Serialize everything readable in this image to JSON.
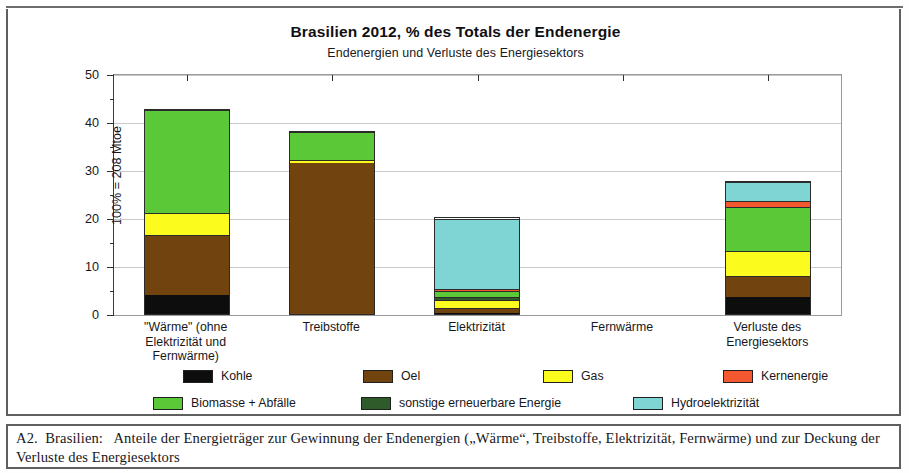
{
  "figure": {
    "caption_label": "A2.  Brasilien:   ",
    "caption_text": "Anteile der Energieträger zur Gewinnung der Endenergien („Wärme“, Treibstoffe, Elektrizität, Fernwärme) und zur Deckung der Verluste des Energiesektors"
  },
  "chart_data": {
    "type": "bar",
    "stacked": true,
    "title": "Brasilien  2012,  % des Totals der Endenergie",
    "subtitle": "Endenergien und Verluste des Energiesektors",
    "ylabel": "100% = 208 Mtoe",
    "xlabel": "",
    "ylim": [
      0,
      50
    ],
    "yticks": [
      0,
      10,
      20,
      30,
      40,
      50
    ],
    "yticklabels": [
      "0",
      "10",
      "20",
      "30",
      "40",
      "50"
    ],
    "yminorticks": [
      5,
      15,
      25,
      35,
      45
    ],
    "grid": "horizontal",
    "legend_position": "bottom",
    "categories": [
      "\"Wärme\" (ohne Elektrizität und Fernwärme)",
      "Treibstoffe",
      "Elektrizität",
      "Fernwärme",
      "Verluste des Energiesektors"
    ],
    "category_lines": [
      [
        "\"Wärme\" (ohne",
        "Elektrizität und",
        "Fernwärme)"
      ],
      [
        "Treibstoffe"
      ],
      [
        "Elektrizität"
      ],
      [
        "Fernwärme"
      ],
      [
        "Verluste des",
        "Energiesektors"
      ]
    ],
    "series": [
      {
        "name": "Kohle",
        "color": "#0d0d0d",
        "values": [
          4.0,
          0.0,
          0.3,
          0.0,
          3.5
        ]
      },
      {
        "name": "Oel",
        "color": "#70430f",
        "values": [
          12.5,
          31.5,
          1.0,
          0.0,
          4.5
        ]
      },
      {
        "name": "Gas",
        "color": "#fbfb1d",
        "values": [
          4.5,
          0.5,
          1.7,
          0.0,
          5.2
        ]
      },
      {
        "name": "Kernenergie",
        "color": "#f4582f",
        "values": [
          0.0,
          0.0,
          0.0,
          0.0,
          1.3
        ]
      },
      {
        "name": "Biomasse + Abfälle",
        "color": "#5bc838",
        "values": [
          21.5,
          6.0,
          1.2,
          0.0,
          9.0
        ]
      },
      {
        "name": "sonstige erneuerbare Energie",
        "color": "#2f5a2a",
        "values": [
          0.0,
          0.0,
          0.5,
          0.0,
          0.0
        ]
      },
      {
        "name": "Hydroelektrizität",
        "color": "#7fd4d4",
        "values": [
          0.0,
          0.0,
          14.8,
          0.0,
          4.0
        ]
      }
    ],
    "stack_order": [
      "Kohle",
      "Oel",
      "Gas",
      "sonstige erneuerbare Energie",
      "Biomasse + Abfälle",
      "Kernenergie",
      "Hydroelektrizität"
    ],
    "totals": [
      42.5,
      38.0,
      19.5,
      0.0,
      27.5
    ],
    "bar_segments": [
      [
        {
          "name": "Kohle",
          "from": 0.0,
          "to": 4.0
        },
        {
          "name": "Oel",
          "from": 4.0,
          "to": 16.5
        },
        {
          "name": "Gas",
          "from": 16.5,
          "to": 21.0
        },
        {
          "name": "Biomasse + Abfälle",
          "from": 21.0,
          "to": 42.5
        }
      ],
      [
        {
          "name": "Oel",
          "from": 0.0,
          "to": 31.5
        },
        {
          "name": "Gas",
          "from": 31.5,
          "to": 32.0
        },
        {
          "name": "Biomasse + Abfälle",
          "from": 32.0,
          "to": 38.0
        }
      ],
      [
        {
          "name": "Kohle",
          "from": 0.0,
          "to": 0.3
        },
        {
          "name": "Oel",
          "from": 0.3,
          "to": 1.3
        },
        {
          "name": "Gas",
          "from": 1.3,
          "to": 3.0
        },
        {
          "name": "sonstige erneuerbare Energie",
          "from": 3.0,
          "to": 3.5
        },
        {
          "name": "Biomasse + Abfälle",
          "from": 3.5,
          "to": 4.7
        },
        {
          "name": "Kernenergie",
          "from": 4.7,
          "to": 5.2
        },
        {
          "name": "Hydroelektrizität",
          "from": 5.2,
          "to": 19.9
        }
      ],
      [],
      [
        {
          "name": "Kohle",
          "from": 0.0,
          "to": 3.5
        },
        {
          "name": "Oel",
          "from": 3.5,
          "to": 8.0
        },
        {
          "name": "Gas",
          "from": 8.0,
          "to": 13.2
        },
        {
          "name": "Biomasse + Abfälle",
          "from": 13.2,
          "to": 22.2
        },
        {
          "name": "Kernenergie",
          "from": 22.2,
          "to": 23.5
        },
        {
          "name": "Hydroelektrizität",
          "from": 23.5,
          "to": 27.5
        }
      ]
    ],
    "legend": [
      {
        "label": "Kohle",
        "color": "#0d0d0d"
      },
      {
        "label": "Oel",
        "color": "#70430f"
      },
      {
        "label": "Gas",
        "color": "#fbfb1d"
      },
      {
        "label": "Kernenergie",
        "color": "#f4582f"
      },
      {
        "label": "Biomasse + Abfälle",
        "color": "#5bc838"
      },
      {
        "label": "sonstige erneuerbare Energie",
        "color": "#2f5a2a"
      },
      {
        "label": "Hydroelektrizität",
        "color": "#7fd4d4"
      }
    ],
    "legend_rows": [
      [
        0,
        1,
        2,
        3
      ],
      [
        4,
        5,
        6
      ]
    ]
  }
}
